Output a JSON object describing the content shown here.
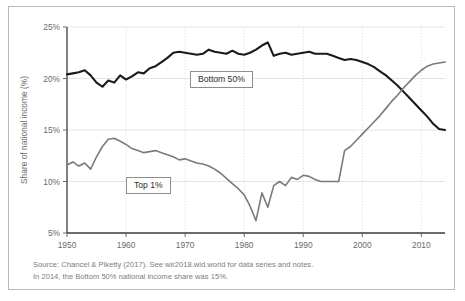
{
  "figure": {
    "background": "#ffffff",
    "border_color": "#b9b9b9"
  },
  "source": {
    "line1": "Source: Chancel & Piketty (2017). See wir2018.wid.world for data series and notes.",
    "line2": "In 2014, the Bottom 50% national income share was 15%."
  },
  "labels": {
    "bottom50": "Bottom 50%",
    "top1": "Top 1%"
  },
  "chart_data": {
    "type": "line",
    "title": "",
    "subtitle": "",
    "xlabel": "",
    "ylabel": "Share of national income (%)",
    "xlim": [
      1950,
      2014
    ],
    "ylim": [
      5,
      25
    ],
    "xticks": [
      1950,
      1960,
      1970,
      1980,
      1990,
      2000,
      2010
    ],
    "xticklabels": [
      "1950",
      "1960",
      "1970",
      "1980",
      "1990",
      "2000",
      "2010"
    ],
    "yticks": [
      5,
      10,
      15,
      20,
      25
    ],
    "yticklabels": [
      "5%",
      "10%",
      "15%",
      "20%",
      "25%"
    ],
    "grid": true,
    "grid_color": "#d8d8d8",
    "legend": "inline-boxed-labels",
    "annotations": [
      {
        "text": "Bottom 50%",
        "series": "Bottom 50%",
        "x": 1972,
        "y": 21.2
      },
      {
        "text": "Top 1%",
        "series": "Top 1%",
        "x": 1962,
        "y": 9.9
      }
    ],
    "x": [
      1950,
      1951,
      1952,
      1953,
      1954,
      1955,
      1956,
      1957,
      1958,
      1959,
      1960,
      1961,
      1962,
      1963,
      1964,
      1965,
      1966,
      1967,
      1968,
      1969,
      1970,
      1971,
      1972,
      1973,
      1974,
      1975,
      1976,
      1977,
      1978,
      1979,
      1980,
      1981,
      1982,
      1983,
      1984,
      1985,
      1986,
      1987,
      1988,
      1989,
      1990,
      1991,
      1992,
      1993,
      1994,
      1995,
      1996,
      1997,
      1998,
      1999,
      2000,
      2001,
      2002,
      2003,
      2004,
      2005,
      2006,
      2007,
      2008,
      2009,
      2010,
      2011,
      2012,
      2013,
      2014
    ],
    "series": [
      {
        "name": "Bottom 50%",
        "color": "#1a1a1a",
        "width": 2.1,
        "values": [
          20.4,
          20.5,
          20.6,
          20.8,
          20.3,
          19.6,
          19.2,
          19.8,
          19.6,
          20.3,
          19.9,
          20.2,
          20.6,
          20.5,
          21.0,
          21.2,
          21.6,
          22.0,
          22.5,
          22.6,
          22.5,
          22.4,
          22.3,
          22.4,
          22.8,
          22.6,
          22.5,
          22.4,
          22.7,
          22.4,
          22.3,
          22.5,
          22.8,
          23.2,
          23.5,
          22.2,
          22.4,
          22.5,
          22.3,
          22.4,
          22.5,
          22.6,
          22.4,
          22.4,
          22.4,
          22.2,
          22.0,
          21.8,
          21.9,
          21.8,
          21.6,
          21.4,
          21.1,
          20.7,
          20.3,
          19.8,
          19.3,
          18.7,
          18.1,
          17.5,
          16.9,
          16.3,
          15.6,
          15.1,
          15.0
        ]
      },
      {
        "name": "Top 1%",
        "color": "#7a7a7a",
        "width": 1.6,
        "values": [
          11.6,
          11.9,
          11.5,
          11.8,
          11.2,
          12.4,
          13.4,
          14.1,
          14.2,
          13.9,
          13.6,
          13.2,
          13.0,
          12.8,
          12.9,
          13.0,
          12.8,
          12.6,
          12.4,
          12.1,
          12.2,
          12.0,
          11.8,
          11.7,
          11.5,
          11.2,
          10.8,
          10.3,
          9.8,
          9.3,
          8.7,
          7.6,
          6.2,
          8.9,
          7.5,
          9.6,
          10.0,
          9.6,
          10.4,
          10.2,
          10.6,
          10.5,
          10.2,
          10.0,
          10.0,
          10.0,
          10.0,
          13.0,
          13.4,
          14.0,
          14.6,
          15.2,
          15.8,
          16.4,
          17.1,
          17.8,
          18.4,
          19.1,
          19.7,
          20.3,
          20.8,
          21.2,
          21.4,
          21.5,
          21.6
        ]
      }
    ]
  }
}
